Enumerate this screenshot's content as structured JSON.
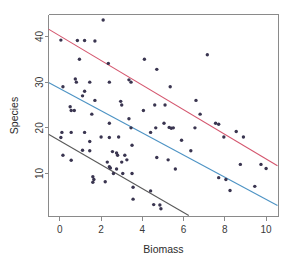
{
  "chart_data": {
    "type": "scatter",
    "title": "",
    "xlabel": "Biomass",
    "ylabel": "Species",
    "xlim": [
      -0.55,
      10.6
    ],
    "ylim": [
      0.6,
      44.8
    ],
    "xticks": [
      0,
      2,
      4,
      6,
      8,
      10
    ],
    "yticks": [
      10,
      20,
      30,
      40
    ],
    "xtick_labels": [
      "0",
      "2",
      "4",
      "6",
      "8",
      "10"
    ],
    "ytick_labels": [
      "10",
      "20",
      "30",
      "40"
    ],
    "grid": false,
    "legend": "none",
    "point_radius": 1.7,
    "point_color": "#3a3550",
    "series": [
      {
        "name": "high",
        "line_color": "#d4566e",
        "line_fit": {
          "x0": -0.55,
          "y0": 41.6,
          "x1": 10.55,
          "y1": 11.7
        },
        "points": [
          {
            "x": 0.05,
            "y": 39.2
          },
          {
            "x": 0.85,
            "y": 39.1
          },
          {
            "x": 1.2,
            "y": 39.1
          },
          {
            "x": 1.7,
            "y": 39.0
          },
          {
            "x": 2.1,
            "y": 43.6
          },
          {
            "x": 0.95,
            "y": 35.0
          },
          {
            "x": 2.35,
            "y": 34.1
          },
          {
            "x": 4.1,
            "y": 35.0
          },
          {
            "x": 4.7,
            "y": 32.8
          },
          {
            "x": 7.15,
            "y": 36.0
          },
          {
            "x": 3.35,
            "y": 30.5
          },
          {
            "x": 3.45,
            "y": 30.0
          },
          {
            "x": 5.35,
            "y": 29.0
          },
          {
            "x": 4.05,
            "y": 23.8
          },
          {
            "x": 4.6,
            "y": 25.0
          },
          {
            "x": 5.1,
            "y": 25.0
          },
          {
            "x": 5.3,
            "y": 20.1
          },
          {
            "x": 5.5,
            "y": 20.0
          },
          {
            "x": 6.6,
            "y": 26.0
          },
          {
            "x": 6.55,
            "y": 20.0
          },
          {
            "x": 6.8,
            "y": 23.0
          },
          {
            "x": 7.55,
            "y": 21.0
          },
          {
            "x": 7.7,
            "y": 20.8
          },
          {
            "x": 7.95,
            "y": 18.0
          },
          {
            "x": 8.55,
            "y": 19.2
          },
          {
            "x": 8.9,
            "y": 18.0
          },
          {
            "x": 8.75,
            "y": 12.0
          },
          {
            "x": 9.45,
            "y": 7.2
          },
          {
            "x": 9.75,
            "y": 12.0
          },
          {
            "x": 10.0,
            "y": 11.1
          }
        ]
      },
      {
        "name": "mid",
        "line_color": "#4d93c4",
        "line_fit": {
          "x0": -0.55,
          "y0": 29.9,
          "x1": 10.55,
          "y1": 3.0
        },
        "points": [
          {
            "x": 0.15,
            "y": 29.0
          },
          {
            "x": 0.75,
            "y": 30.7
          },
          {
            "x": 0.8,
            "y": 30.0
          },
          {
            "x": 1.45,
            "y": 30.0
          },
          {
            "x": 1.1,
            "y": 27.0
          },
          {
            "x": 1.2,
            "y": 28.0
          },
          {
            "x": 0.5,
            "y": 24.6
          },
          {
            "x": 0.55,
            "y": 23.8
          },
          {
            "x": 0.7,
            "y": 23.8
          },
          {
            "x": 1.55,
            "y": 23.0
          },
          {
            "x": 1.7,
            "y": 26.0
          },
          {
            "x": 2.4,
            "y": 30.0
          },
          {
            "x": 2.95,
            "y": 25.8
          },
          {
            "x": 3.0,
            "y": 25.0
          },
          {
            "x": 2.4,
            "y": 21.0
          },
          {
            "x": 3.35,
            "y": 22.0
          },
          {
            "x": 3.45,
            "y": 20.0
          },
          {
            "x": 2.85,
            "y": 18.0
          },
          {
            "x": 2.8,
            "y": 14.0
          },
          {
            "x": 3.5,
            "y": 16.2
          },
          {
            "x": 4.4,
            "y": 19.0
          },
          {
            "x": 4.65,
            "y": 20.0
          },
          {
            "x": 5.05,
            "y": 21.0
          },
          {
            "x": 5.4,
            "y": 19.9
          },
          {
            "x": 4.7,
            "y": 13.5
          },
          {
            "x": 5.25,
            "y": 13.0
          },
          {
            "x": 5.6,
            "y": 11.0
          },
          {
            "x": 5.9,
            "y": 17.3
          },
          {
            "x": 6.35,
            "y": 15.0
          },
          {
            "x": 7.7,
            "y": 9.1
          },
          {
            "x": 8.05,
            "y": 8.7
          },
          {
            "x": 8.25,
            "y": 6.3
          }
        ]
      },
      {
        "name": "low",
        "line_color": "#595959",
        "line_fit": {
          "x0": -0.55,
          "y0": 18.6,
          "x1": 6.25,
          "y1": 0.8
        },
        "points": [
          {
            "x": 0.05,
            "y": 17.9
          },
          {
            "x": 0.1,
            "y": 19.0
          },
          {
            "x": 0.55,
            "y": 19.0
          },
          {
            "x": 0.15,
            "y": 14.0
          },
          {
            "x": 0.55,
            "y": 12.9
          },
          {
            "x": 1.1,
            "y": 15.1
          },
          {
            "x": 1.45,
            "y": 15.0
          },
          {
            "x": 1.2,
            "y": 19.0
          },
          {
            "x": 1.45,
            "y": 17.0
          },
          {
            "x": 2.0,
            "y": 18.0
          },
          {
            "x": 2.4,
            "y": 17.9
          },
          {
            "x": 2.3,
            "y": 12.5
          },
          {
            "x": 2.55,
            "y": 14.8
          },
          {
            "x": 2.75,
            "y": 14.5
          },
          {
            "x": 2.4,
            "y": 11.5
          },
          {
            "x": 2.45,
            "y": 11.2
          },
          {
            "x": 3.0,
            "y": 12.5
          },
          {
            "x": 3.15,
            "y": 14.0
          },
          {
            "x": 3.25,
            "y": 13.0
          },
          {
            "x": 1.6,
            "y": 9.3
          },
          {
            "x": 1.65,
            "y": 8.7
          },
          {
            "x": 1.6,
            "y": 8.1
          },
          {
            "x": 2.2,
            "y": 8.2
          },
          {
            "x": 2.75,
            "y": 11.0
          },
          {
            "x": 2.6,
            "y": 10.0
          },
          {
            "x": 3.05,
            "y": 10.0
          },
          {
            "x": 3.5,
            "y": 10.0
          },
          {
            "x": 3.55,
            "y": 7.0
          },
          {
            "x": 3.55,
            "y": 4.4
          },
          {
            "x": 4.4,
            "y": 6.2
          },
          {
            "x": 4.55,
            "y": 3.2
          },
          {
            "x": 4.85,
            "y": 3.1
          },
          {
            "x": 4.9,
            "y": 2.3
          }
        ]
      }
    ]
  }
}
